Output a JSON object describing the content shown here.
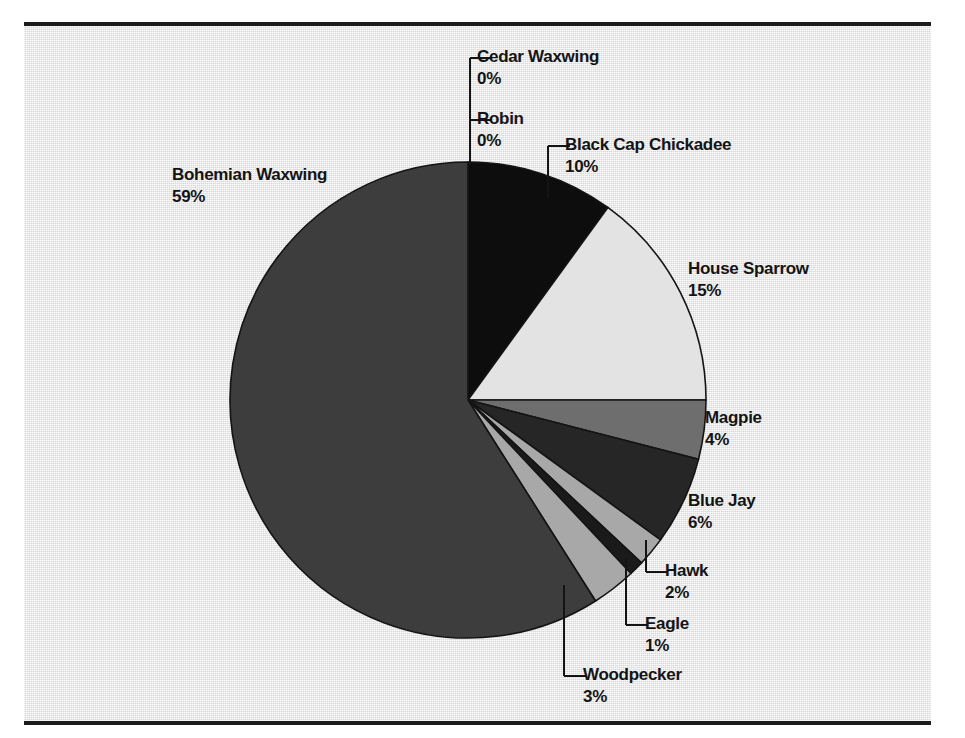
{
  "figure": {
    "background_color": "#e7e7e7",
    "page_color": "#ffffff",
    "rule_color": "#1c1c1c",
    "text_color": "#141414"
  },
  "chart_data": {
    "type": "pie",
    "title": "",
    "subtitle": "",
    "xlabel": "",
    "ylabel": "",
    "grid": false,
    "legend_position": "none",
    "label_format": "name above percent",
    "start_angle_deg": 90,
    "direction": "clockwise",
    "center": {
      "x": 468,
      "y": 400
    },
    "radius": 238,
    "total_percent": 100,
    "categories": [
      "Cedar Waxwing",
      "Robin",
      "Black Cap Chickadee",
      "House Sparrow",
      "Magpie",
      "Blue Jay",
      "Hawk",
      "Eagle",
      "Woodpecker",
      "Bohemian Waxwing"
    ],
    "values": [
      0,
      0,
      10,
      15,
      4,
      6,
      2,
      1,
      3,
      59
    ],
    "value_labels": [
      "0%",
      "0%",
      "10%",
      "15%",
      "4%",
      "6%",
      "2%",
      "1%",
      "3%",
      "59%"
    ],
    "colors": [
      "#e9e9e9",
      "#e9e9e9",
      "#0d0d0d",
      "#e3e3e3",
      "#6e6e6e",
      "#262626",
      "#a8a8a8",
      "#1a1a1a",
      "#a8a8a8",
      "#3d3d3d"
    ],
    "slices": [
      {
        "name": "Cedar Waxwing",
        "percent": 0,
        "label": "0%",
        "color": "#e9e9e9",
        "leader": true
      },
      {
        "name": "Robin",
        "percent": 0,
        "label": "0%",
        "color": "#e9e9e9",
        "leader": true
      },
      {
        "name": "Black Cap Chickadee",
        "percent": 10,
        "label": "10%",
        "color": "#0d0d0d",
        "leader": true
      },
      {
        "name": "House Sparrow",
        "percent": 15,
        "label": "15%",
        "color": "#e3e3e3",
        "leader": false
      },
      {
        "name": "Magpie",
        "percent": 4,
        "label": "4%",
        "color": "#6e6e6e",
        "leader": false
      },
      {
        "name": "Blue Jay",
        "percent": 6,
        "label": "6%",
        "color": "#262626",
        "leader": false
      },
      {
        "name": "Hawk",
        "percent": 2,
        "label": "2%",
        "color": "#a8a8a8",
        "leader": true
      },
      {
        "name": "Eagle",
        "percent": 1,
        "label": "1%",
        "color": "#1a1a1a",
        "leader": true
      },
      {
        "name": "Woodpecker",
        "percent": 3,
        "label": "3%",
        "color": "#a8a8a8",
        "leader": true
      },
      {
        "name": "Bohemian Waxwing",
        "percent": 59,
        "label": "59%",
        "color": "#3d3d3d",
        "leader": false
      }
    ]
  },
  "labels": {
    "cedar_waxwing": {
      "name": "Cedar Waxwing",
      "value": "0%"
    },
    "robin": {
      "name": "Robin",
      "value": "0%"
    },
    "black_cap_chickadee": {
      "name": "Black Cap Chickadee",
      "value": "10%"
    },
    "house_sparrow": {
      "name": "House Sparrow",
      "value": "15%"
    },
    "magpie": {
      "name": "Magpie",
      "value": "4%"
    },
    "blue_jay": {
      "name": "Blue Jay",
      "value": "6%"
    },
    "hawk": {
      "name": "Hawk",
      "value": "2%"
    },
    "eagle": {
      "name": "Eagle",
      "value": "1%"
    },
    "woodpecker": {
      "name": "Woodpecker",
      "value": "3%"
    },
    "bohemian_waxwing": {
      "name": "Bohemian Waxwing",
      "value": "59%"
    }
  }
}
